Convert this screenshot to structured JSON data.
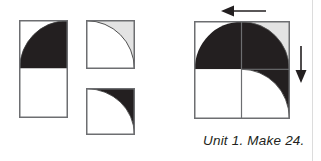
{
  "figure": {
    "caption": "Unit 1. Make 24.",
    "colors": {
      "dark": "#231f20",
      "light": "#e3e3e3",
      "white": "#ffffff",
      "outline": "#6d6e71",
      "arrow": "#231f20",
      "page_edge": "#dcdcdc",
      "background": "#ffffff"
    },
    "pieces": [
      {
        "id": "piece-tall-rectangle",
        "name": "tall-rectangle-with-dark-quarter-circle",
        "shape": "rectangle",
        "fill_primary": "#ffffff",
        "fill_accent": "#231f20",
        "accent_shape": "quarter-circle",
        "accent_corner": "top-right",
        "x": 19,
        "y": 20,
        "width": 48,
        "height": 97
      },
      {
        "id": "piece-light-square",
        "name": "light-square-with-white-quarter-circle",
        "shape": "square",
        "fill_primary": "#e3e3e3",
        "fill_accent": "#ffffff",
        "accent_shape": "quarter-circle",
        "accent_corner": "bottom-left",
        "x": 86,
        "y": 20,
        "width": 48,
        "height": 48
      },
      {
        "id": "piece-dark-square",
        "name": "dark-square-with-white-quarter-circle",
        "shape": "square",
        "fill_primary": "#231f20",
        "fill_accent": "#ffffff",
        "accent_shape": "quarter-circle",
        "accent_corner": "bottom-left",
        "x": 86,
        "y": 88,
        "width": 48,
        "height": 46
      }
    ],
    "assembly": {
      "id": "assembled-block",
      "name": "assembled-quilt-block",
      "x": 194,
      "y": 21,
      "width": 95,
      "height": 97,
      "quadrants": [
        {
          "name": "top-left",
          "fill": "#ffffff",
          "curve_fill": "#231f20",
          "curve_corner": "top-right"
        },
        {
          "name": "top-right",
          "fill": "#e3e3e3",
          "curve_fill": "#231f20",
          "curve_corner": "bottom-left"
        },
        {
          "name": "bottom-left",
          "fill": "#ffffff",
          "curve_fill": "none",
          "curve_corner": "none"
        },
        {
          "name": "bottom-right",
          "fill": "#231f20",
          "curve_fill": "#ffffff",
          "curve_corner": "bottom-left"
        }
      ]
    },
    "arrows": [
      {
        "id": "arrow-left",
        "name": "pressing-direction-arrow-left",
        "direction": "left",
        "x": 221,
        "y": 4,
        "length": 44
      },
      {
        "id": "arrow-down",
        "name": "pressing-direction-arrow-down",
        "direction": "down",
        "x": 294,
        "y": 46,
        "length": 36
      }
    ],
    "caption_position": {
      "x": 203,
      "y": 133
    }
  }
}
